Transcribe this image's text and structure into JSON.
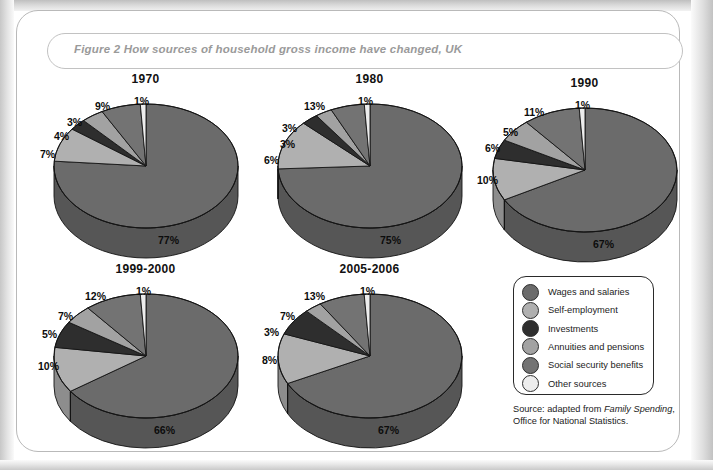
{
  "figure": {
    "caption": "Figure 2  How sources of household gross income have changed, UK",
    "source_prefix": "Source: adapted from ",
    "source_italic": "Family Spending",
    "source_suffix": ", Office for National Statistics."
  },
  "legend": {
    "items": [
      {
        "label": "Wages and salaries",
        "color": "#6b6b6b"
      },
      {
        "label": "Self-employment",
        "color": "#b0b0b0"
      },
      {
        "label": "Investments",
        "color": "#2e2e2e"
      },
      {
        "label": "Annuities and pensions",
        "color": "#a2a2a2"
      },
      {
        "label": "Social security benefits",
        "color": "#737373"
      },
      {
        "label": "Other sources",
        "color": "#ededed"
      }
    ]
  },
  "chart_data": [
    {
      "type": "pie",
      "title": "1970",
      "categories": [
        "Wages and salaries",
        "Self-employment",
        "Investments",
        "Annuities and pensions",
        "Social security benefits",
        "Other sources"
      ],
      "values": [
        77,
        9,
        3,
        4,
        7,
        1
      ],
      "labels": [
        "77%",
        "9%",
        "3%",
        "4%",
        "7%",
        "1%"
      ],
      "colors": [
        "#6b6b6b",
        "#b0b0b0",
        "#2e2e2e",
        "#a2a2a2",
        "#737373",
        "#ededed"
      ],
      "units": "percent",
      "legend_position": "bottom-right"
    },
    {
      "type": "pie",
      "title": "1980",
      "categories": [
        "Wages and salaries",
        "Self-employment",
        "Investments",
        "Annuities and pensions",
        "Social security benefits",
        "Other sources"
      ],
      "values": [
        75,
        13,
        3,
        3,
        6,
        1
      ],
      "labels": [
        "75%",
        "13%",
        "3%",
        "3%",
        "6%",
        "1%"
      ],
      "colors": [
        "#6b6b6b",
        "#b0b0b0",
        "#2e2e2e",
        "#a2a2a2",
        "#737373",
        "#ededed"
      ],
      "units": "percent",
      "legend_position": "bottom-right"
    },
    {
      "type": "pie",
      "title": "1990",
      "categories": [
        "Wages and salaries",
        "Self-employment",
        "Investments",
        "Annuities and pensions",
        "Social security benefits",
        "Other sources"
      ],
      "values": [
        67,
        11,
        5,
        6,
        10,
        1
      ],
      "labels": [
        "67%",
        "11%",
        "5%",
        "6%",
        "10%",
        "1%"
      ],
      "colors": [
        "#6b6b6b",
        "#b0b0b0",
        "#2e2e2e",
        "#a2a2a2",
        "#737373",
        "#ededed"
      ],
      "units": "percent",
      "legend_position": "bottom-right"
    },
    {
      "type": "pie",
      "title": "1999-2000",
      "categories": [
        "Wages and salaries",
        "Self-employment",
        "Investments",
        "Annuities and pensions",
        "Social security benefits",
        "Other sources"
      ],
      "values": [
        66,
        12,
        7,
        5,
        10,
        1
      ],
      "labels": [
        "66%",
        "12%",
        "7%",
        "5%",
        "10%",
        "1%"
      ],
      "colors": [
        "#6b6b6b",
        "#b0b0b0",
        "#2e2e2e",
        "#a2a2a2",
        "#737373",
        "#ededed"
      ],
      "units": "percent",
      "legend_position": "bottom-right"
    },
    {
      "type": "pie",
      "title": "2005-2006",
      "categories": [
        "Wages and salaries",
        "Self-employment",
        "Investments",
        "Annuities and pensions",
        "Social security benefits",
        "Other sources"
      ],
      "values": [
        67,
        13,
        7,
        3,
        8,
        1
      ],
      "labels": [
        "67%",
        "13%",
        "7%",
        "3%",
        "8%",
        "1%"
      ],
      "colors": [
        "#6b6b6b",
        "#b0b0b0",
        "#2e2e2e",
        "#a2a2a2",
        "#737373",
        "#ededed"
      ],
      "units": "percent",
      "legend_position": "bottom-right"
    }
  ]
}
